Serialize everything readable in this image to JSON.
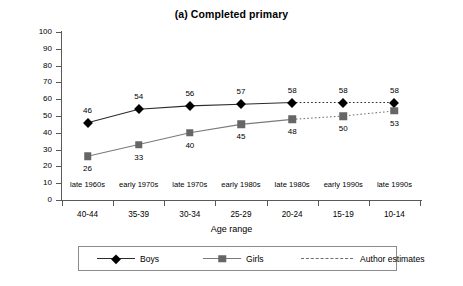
{
  "chart_data": {
    "type": "line",
    "title": "(a) Completed primary",
    "xlabel": "Age range",
    "ylabel": "Percentage",
    "ylim": [
      0,
      100
    ],
    "ytick_step": 10,
    "yticks": [
      100,
      90,
      80,
      70,
      60,
      50,
      40,
      30,
      20,
      10,
      0
    ],
    "grid": false,
    "legend_position": "bottom",
    "categories": [
      "40-44",
      "35-39",
      "30-34",
      "25-29",
      "20-24",
      "15-19",
      "10-14"
    ],
    "secondary_categories": [
      "late 1960s",
      "early 1970s",
      "late 1970s",
      "early 1980s",
      "late 1980s",
      "early 1990s",
      "late 1990s"
    ],
    "series": [
      {
        "name": "Boys",
        "values": [
          46,
          54,
          56,
          57,
          58,
          58,
          58
        ],
        "marker": "diamond",
        "color": "#000000",
        "line_color": "#2b2b2b",
        "estimates_from_index": 4
      },
      {
        "name": "Girls",
        "values": [
          26,
          33,
          40,
          45,
          48,
          50,
          53
        ],
        "marker": "square",
        "color": "#666666",
        "line_color": "#7a7a7a",
        "estimates_from_index": 4
      }
    ],
    "legend": [
      {
        "label": "Boys",
        "style": "solid-diamond"
      },
      {
        "label": "Girls",
        "style": "solid-square"
      },
      {
        "label": "Author estimates",
        "style": "dotted"
      }
    ],
    "annotations": {
      "boys_label_offsets": [
        "above",
        "above",
        "above",
        "above",
        "above",
        "above",
        "above"
      ],
      "girls_label_offsets": [
        "below",
        "below",
        "below",
        "below",
        "below",
        "below",
        "below"
      ]
    }
  }
}
